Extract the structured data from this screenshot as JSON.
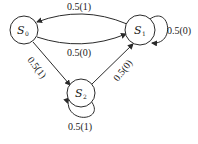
{
  "diagram": {
    "type": "state-transition",
    "nodes": [
      {
        "id": "S0",
        "label": "S",
        "sub": "0"
      },
      {
        "id": "S1",
        "label": "S",
        "sub": "1"
      },
      {
        "id": "S2",
        "label": "S",
        "sub": "2"
      }
    ],
    "edges": [
      {
        "from": "S1",
        "to": "S0",
        "label": "0.5(1)"
      },
      {
        "from": "S1",
        "to": "S1",
        "label": "0.5(0)"
      },
      {
        "from": "S0",
        "to": "S1",
        "label": "0.5(0)"
      },
      {
        "from": "S0",
        "to": "S2",
        "label": "0.5(1)"
      },
      {
        "from": "S2",
        "to": "S1",
        "label": "0.5(0)"
      },
      {
        "from": "S2",
        "to": "S2",
        "label": "0.5(1)"
      }
    ]
  }
}
